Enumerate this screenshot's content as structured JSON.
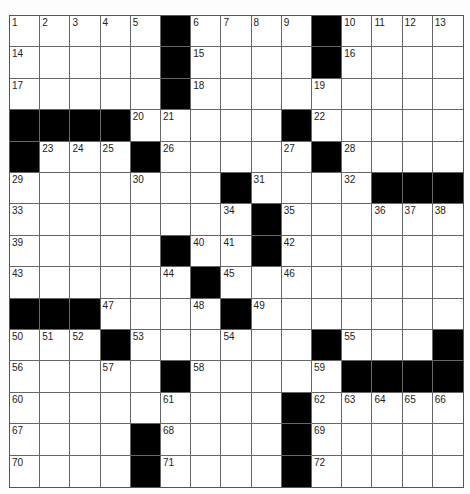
{
  "puzzle": {
    "rows": 15,
    "cols": 15,
    "layout": [
      ".....#....#....",
      ".....#....#....",
      ".....#.........",
      "####.....#.....",
      "#...#.....#....",
      ".......#....###",
      "........#......",
      ".....#..#......",
      "......#........",
      "###....#.......",
      "...#......#...#",
      ".....#.....####",
      ".........#.....",
      "....#....#.....",
      "....#....#....."
    ],
    "numbers": [
      {
        "r": 0,
        "c": 0,
        "n": "1"
      },
      {
        "r": 0,
        "c": 1,
        "n": "2"
      },
      {
        "r": 0,
        "c": 2,
        "n": "3"
      },
      {
        "r": 0,
        "c": 3,
        "n": "4"
      },
      {
        "r": 0,
        "c": 4,
        "n": "5"
      },
      {
        "r": 0,
        "c": 6,
        "n": "6"
      },
      {
        "r": 0,
        "c": 7,
        "n": "7"
      },
      {
        "r": 0,
        "c": 8,
        "n": "8"
      },
      {
        "r": 0,
        "c": 9,
        "n": "9"
      },
      {
        "r": 0,
        "c": 11,
        "n": "10"
      },
      {
        "r": 0,
        "c": 12,
        "n": "11"
      },
      {
        "r": 0,
        "c": 13,
        "n": "12"
      },
      {
        "r": 0,
        "c": 14,
        "n": "13"
      },
      {
        "r": 1,
        "c": 0,
        "n": "14"
      },
      {
        "r": 1,
        "c": 6,
        "n": "15"
      },
      {
        "r": 1,
        "c": 11,
        "n": "16"
      },
      {
        "r": 2,
        "c": 0,
        "n": "17"
      },
      {
        "r": 2,
        "c": 6,
        "n": "18"
      },
      {
        "r": 2,
        "c": 10,
        "n": "19"
      },
      {
        "r": 3,
        "c": 4,
        "n": "20"
      },
      {
        "r": 3,
        "c": 5,
        "n": "21"
      },
      {
        "r": 3,
        "c": 10,
        "n": "22"
      },
      {
        "r": 4,
        "c": 1,
        "n": "23"
      },
      {
        "r": 4,
        "c": 2,
        "n": "24"
      },
      {
        "r": 4,
        "c": 3,
        "n": "25"
      },
      {
        "r": 4,
        "c": 5,
        "n": "26"
      },
      {
        "r": 4,
        "c": 9,
        "n": "27"
      },
      {
        "r": 4,
        "c": 11,
        "n": "28"
      },
      {
        "r": 5,
        "c": 0,
        "n": "29"
      },
      {
        "r": 5,
        "c": 4,
        "n": "30"
      },
      {
        "r": 5,
        "c": 8,
        "n": "31"
      },
      {
        "r": 5,
        "c": 11,
        "n": "32"
      },
      {
        "r": 6,
        "c": 0,
        "n": "33"
      },
      {
        "r": 6,
        "c": 7,
        "n": "34"
      },
      {
        "r": 6,
        "c": 9,
        "n": "35"
      },
      {
        "r": 6,
        "c": 12,
        "n": "36"
      },
      {
        "r": 6,
        "c": 13,
        "n": "37"
      },
      {
        "r": 6,
        "c": 14,
        "n": "38"
      },
      {
        "r": 7,
        "c": 0,
        "n": "39"
      },
      {
        "r": 7,
        "c": 6,
        "n": "40"
      },
      {
        "r": 7,
        "c": 7,
        "n": "41"
      },
      {
        "r": 7,
        "c": 9,
        "n": "42"
      },
      {
        "r": 8,
        "c": 0,
        "n": "43"
      },
      {
        "r": 8,
        "c": 5,
        "n": "44"
      },
      {
        "r": 8,
        "c": 7,
        "n": "45"
      },
      {
        "r": 8,
        "c": 9,
        "n": "46"
      },
      {
        "r": 9,
        "c": 3,
        "n": "47"
      },
      {
        "r": 9,
        "c": 6,
        "n": "48"
      },
      {
        "r": 9,
        "c": 8,
        "n": "49"
      },
      {
        "r": 10,
        "c": 0,
        "n": "50"
      },
      {
        "r": 10,
        "c": 1,
        "n": "51"
      },
      {
        "r": 10,
        "c": 2,
        "n": "52"
      },
      {
        "r": 10,
        "c": 4,
        "n": "53"
      },
      {
        "r": 10,
        "c": 7,
        "n": "54"
      },
      {
        "r": 10,
        "c": 11,
        "n": "55"
      },
      {
        "r": 11,
        "c": 0,
        "n": "56"
      },
      {
        "r": 11,
        "c": 3,
        "n": "57"
      },
      {
        "r": 11,
        "c": 6,
        "n": "58"
      },
      {
        "r": 11,
        "c": 10,
        "n": "59"
      },
      {
        "r": 12,
        "c": 0,
        "n": "60"
      },
      {
        "r": 12,
        "c": 5,
        "n": "61"
      },
      {
        "r": 12,
        "c": 10,
        "n": "62"
      },
      {
        "r": 12,
        "c": 11,
        "n": "63"
      },
      {
        "r": 12,
        "c": 12,
        "n": "64"
      },
      {
        "r": 12,
        "c": 13,
        "n": "65"
      },
      {
        "r": 12,
        "c": 14,
        "n": "66"
      },
      {
        "r": 13,
        "c": 0,
        "n": "67"
      },
      {
        "r": 13,
        "c": 5,
        "n": "68"
      },
      {
        "r": 13,
        "c": 10,
        "n": "69"
      },
      {
        "r": 14,
        "c": 0,
        "n": "70"
      },
      {
        "r": 14,
        "c": 5,
        "n": "71"
      },
      {
        "r": 14,
        "c": 10,
        "n": "72"
      }
    ]
  }
}
